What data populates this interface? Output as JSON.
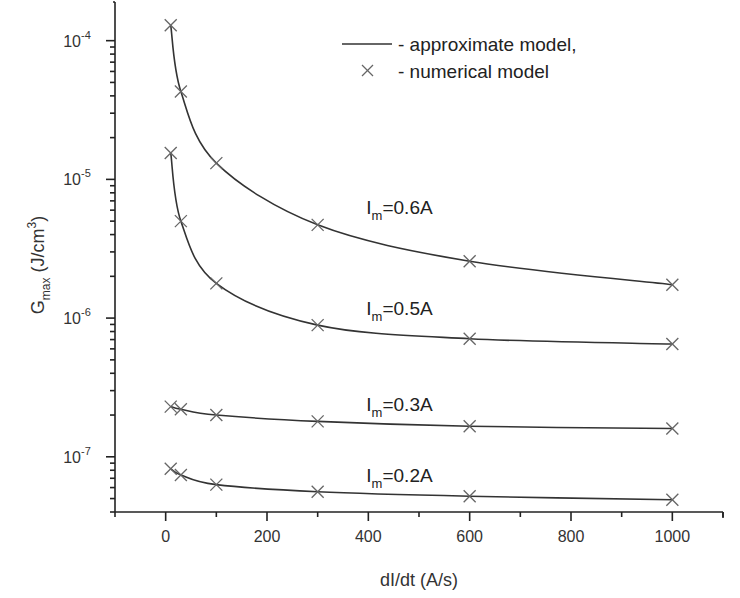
{
  "chart_data": {
    "type": "line",
    "title": "",
    "xlabel": "dI/dt (A/s)",
    "ylabel": {
      "main": "G",
      "sub": "max",
      "unit_pre": " (J/cm",
      "unit_sup": "3",
      "unit_post": ")"
    },
    "xlim": [
      -100,
      1100
    ],
    "ylim": [
      4e-08,
      0.00019
    ],
    "yscale": "log",
    "grid": false,
    "x_ticks": [
      0,
      200,
      400,
      600,
      800,
      1000
    ],
    "x_tick_labels": [
      "0",
      "200",
      "400",
      "600",
      "800",
      "1000"
    ],
    "y_ticks": [
      1e-07,
      1e-06,
      1e-05,
      0.0001
    ],
    "y_tick_labels": [
      {
        "base": "10",
        "exp": "-7"
      },
      {
        "base": "10",
        "exp": "-6"
      },
      {
        "base": "10",
        "exp": "-5"
      },
      {
        "base": "10",
        "exp": "-4"
      }
    ],
    "legend": {
      "placement": "top-right",
      "entries": [
        {
          "symbol": "line",
          "label": "- approximate model,"
        },
        {
          "symbol": "cross",
          "label": "- numerical model"
        }
      ]
    },
    "x": [
      10,
      30,
      100,
      300,
      600,
      1000
    ],
    "series": [
      {
        "name": "Im=0.6A",
        "label": {
          "pre": "I",
          "sub": "m",
          "post": "=0.6A"
        },
        "label_at": [
          400,
          5.6e-06
        ],
        "values": [
          0.000129,
          4.3e-05,
          1.31e-05,
          4.7e-06,
          2.57e-06,
          1.74e-06
        ]
      },
      {
        "name": "Im=0.5A",
        "label": {
          "pre": "I",
          "sub": "m",
          "post": "=0.5A"
        },
        "label_at": [
          400,
          1.05e-06
        ],
        "values": [
          1.55e-05,
          5e-06,
          1.78e-06,
          8.9e-07,
          7.1e-07,
          6.5e-07
        ]
      },
      {
        "name": "Im=0.3A",
        "label": {
          "pre": "I",
          "sub": "m",
          "post": "=0.3A"
        },
        "label_at": [
          400,
          2.15e-07
        ],
        "values": [
          2.3e-07,
          2.2e-07,
          2e-07,
          1.8e-07,
          1.66e-07,
          1.6e-07
        ]
      },
      {
        "name": "Im=0.2A",
        "label": {
          "pre": "I",
          "sub": "m",
          "post": "=0.2A"
        },
        "label_at": [
          400,
          6.6e-08
        ],
        "values": [
          8.2e-08,
          7.4e-08,
          6.3e-08,
          5.6e-08,
          5.2e-08,
          4.9e-08
        ]
      }
    ]
  }
}
